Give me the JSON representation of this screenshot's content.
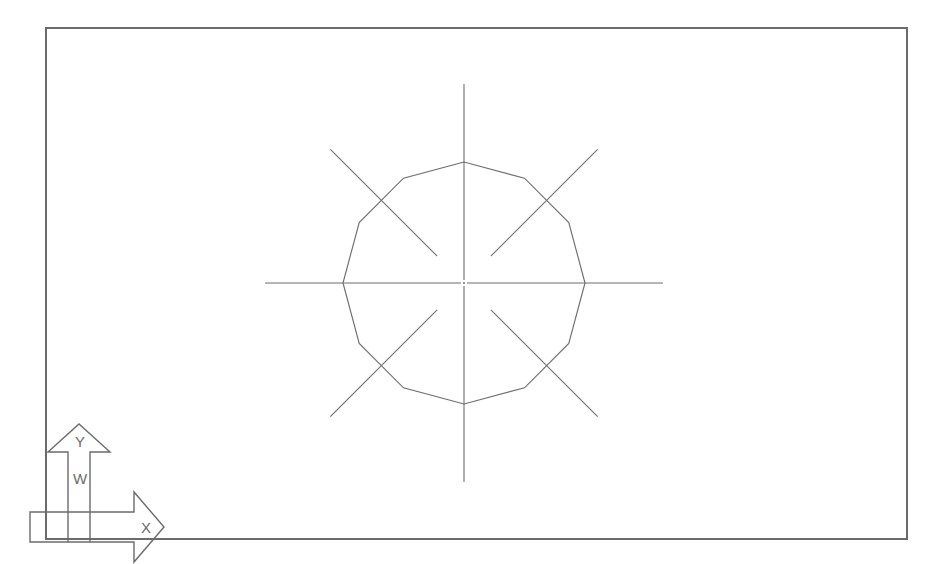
{
  "app": {
    "title": "CAD Drawing Area",
    "background_color": "#ffffff",
    "line_color": "#6e6e6e",
    "border_color": "#6b6b6b"
  },
  "viewport": {
    "name": "drawing-viewport",
    "frame": {
      "x": 46,
      "y": 28,
      "width": 861,
      "height": 511
    }
  },
  "ucs_icon": {
    "name": "ucs-icon",
    "x_axis_label": "X",
    "y_axis_label": "Y",
    "world_label": "W",
    "origin_x": 68,
    "origin_y": 512
  },
  "drawing": {
    "center": {
      "x": 464,
      "y": 283
    },
    "polygon": {
      "name": "dodecagon",
      "sides": 12,
      "circumradius": 121,
      "start_angle_deg": 90
    },
    "radial_lines": {
      "name": "construction-lines",
      "count": 8,
      "angles_deg": [
        0,
        45,
        90,
        135,
        180,
        225,
        270,
        315
      ],
      "axis_outer_radius": 199,
      "axis_inner_gap": 3,
      "diagonal_outer_radius": 189,
      "diagonal_inner_gap": 38
    },
    "center_mark": {
      "name": "center-point",
      "radius": 1.0
    }
  }
}
